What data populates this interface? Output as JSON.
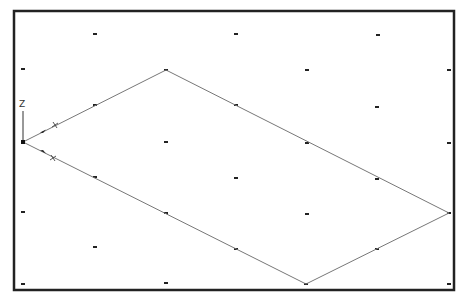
{
  "viewport": {
    "frame": {
      "x": 14,
      "y": 11,
      "width": 440,
      "height": 279,
      "stroke": "#222222",
      "stroke_width": 2.5
    },
    "background": "#ffffff"
  },
  "grid": {
    "type": "isometric-snap-grid",
    "dot_color": "#222222",
    "dot_size": 3,
    "dots": [
      [
        23,
        69
      ],
      [
        23,
        142
      ],
      [
        23,
        212
      ],
      [
        23,
        284
      ],
      [
        95,
        34
      ],
      [
        95,
        105
      ],
      [
        95,
        177
      ],
      [
        95,
        247
      ],
      [
        166,
        70
      ],
      [
        166,
        142
      ],
      [
        166,
        213
      ],
      [
        166,
        283
      ],
      [
        236,
        34
      ],
      [
        236,
        105
      ],
      [
        236,
        178
      ],
      [
        236,
        249
      ],
      [
        307,
        70
      ],
      [
        307,
        143
      ],
      [
        307,
        214
      ],
      [
        306,
        284
      ],
      [
        378,
        35
      ],
      [
        377,
        107
      ],
      [
        377,
        179
      ],
      [
        377,
        249
      ],
      [
        449,
        70
      ],
      [
        449,
        143
      ],
      [
        449,
        213
      ],
      [
        449,
        284
      ]
    ]
  },
  "shape": {
    "type": "parallelogram",
    "stroke": "#777777",
    "stroke_width": 1,
    "vertices": [
      [
        23,
        142
      ],
      [
        166,
        70
      ],
      [
        449,
        213
      ],
      [
        306,
        284
      ]
    ]
  },
  "ucs_icon": {
    "origin": [
      23,
      142
    ],
    "z_label": "Z",
    "z_label_pos": [
      19,
      107
    ],
    "z_axis_end": [
      23,
      111
    ],
    "x_axis_marker": {
      "arrow": [
        43,
        131
      ],
      "tick": [
        55,
        125
      ],
      "label": "X"
    },
    "y_axis_marker": {
      "arrow": [
        43,
        152
      ],
      "tick": [
        53,
        158
      ],
      "label": "X"
    },
    "color": "#333333"
  }
}
